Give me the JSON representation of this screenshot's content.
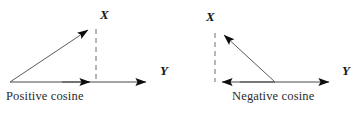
{
  "figure": {
    "width": 357,
    "height": 113,
    "background_color": "#ffffff",
    "line_color": "#4a4a4a",
    "arrow_color": "#0d0d0d",
    "text_color": "#1a1a1a"
  },
  "diagrams": [
    {
      "id": "positive-cosine",
      "caption": "Positive  cosine",
      "vertical_axis_label": "X",
      "horizontal_axis_label": "Y",
      "origin": {
        "x": 10,
        "y": 82
      },
      "resultant_tip": {
        "x": 93,
        "y": 26
      },
      "horizontal_axis_tip": {
        "x": 152,
        "y": 82
      },
      "projection_tip": {
        "x": 95,
        "y": 82
      },
      "dashed_line": {
        "x": 96,
        "y_top": 29,
        "y_bottom": 82
      },
      "projection_direction": "right",
      "resultant_direction": "up-right"
    },
    {
      "id": "negative-cosine",
      "caption": "Negative  cosine",
      "vertical_axis_label": "X",
      "horizontal_axis_label": "Y",
      "origin": {
        "x": 275,
        "y": 82
      },
      "resultant_tip": {
        "x": 219,
        "y": 30
      },
      "horizontal_axis_tip": {
        "x": 335,
        "y": 82
      },
      "projection_tip": {
        "x": 217,
        "y": 82
      },
      "dashed_line": {
        "x": 215,
        "y_top": 33,
        "y_bottom": 82
      },
      "projection_direction": "left",
      "resultant_direction": "up-left"
    }
  ]
}
